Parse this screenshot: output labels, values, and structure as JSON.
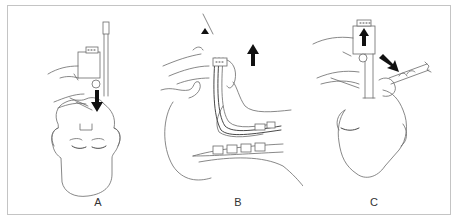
{
  "figure": {
    "type": "medical-line-illustration",
    "panels": [
      {
        "label": "A",
        "description": "Frontal view of supine head; device held above mouth, black arrow pointing down (insertion)"
      },
      {
        "label": "B",
        "description": "Lateral cross-section of head and airway; tube in pharynx, black arrow pointing up (withdrawal)"
      },
      {
        "label": "C",
        "description": "Frontal view of head; device held above, black arrow up and diagonal arrow toward right (tube removal)"
      }
    ],
    "colors": {
      "line": "#6a6a6a",
      "arrow": "#111111",
      "frame_border": "#c4c4c4",
      "background": "#ffffff"
    },
    "icons": [
      "arrow-down-icon",
      "arrow-up-icon",
      "arrow-diagonal-icon"
    ]
  }
}
